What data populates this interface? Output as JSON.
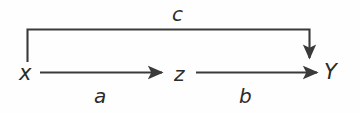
{
  "diagram": {
    "type": "mediation-path-diagram",
    "background_color": "#fefefe",
    "stroke_color": "#3a3a3a",
    "text_color": "#2b2b2b",
    "nodes": [
      {
        "id": "x",
        "label": "x",
        "x": 27,
        "y": 75
      },
      {
        "id": "z",
        "label": "z",
        "x": 182,
        "y": 75
      },
      {
        "id": "Y",
        "label": "Y",
        "x": 332,
        "y": 75
      }
    ],
    "edges": [
      {
        "id": "a",
        "label": "a",
        "from": "x",
        "to": "z",
        "shape": "straight-horizontal",
        "label_position": "below"
      },
      {
        "id": "b",
        "label": "b",
        "from": "z",
        "to": "Y",
        "shape": "straight-horizontal",
        "label_position": "below"
      },
      {
        "id": "c",
        "label": "c",
        "from": "x",
        "to": "Y",
        "shape": "bracket-over-top",
        "label_position": "above"
      }
    ]
  }
}
